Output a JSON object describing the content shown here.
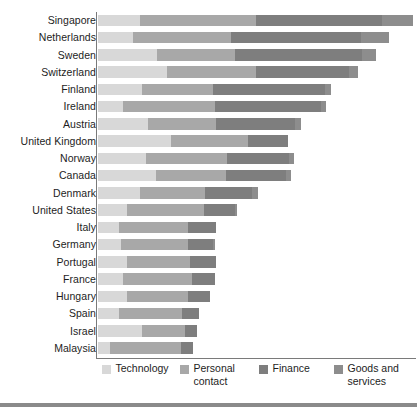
{
  "chart_data": {
    "type": "bar",
    "orientation": "horizontal",
    "stacked": true,
    "title": "",
    "subtitle": "",
    "xlabel": "",
    "ylabel": "",
    "grid": false,
    "axis_tick_labels": [],
    "legend_position": "bottom",
    "legend": [
      {
        "name": "Technology",
        "color": "#d8d8d8"
      },
      {
        "name": "Personal contact",
        "color": "#a8a8a8"
      },
      {
        "name": "Finance",
        "color": "#7e7e7e"
      },
      {
        "name": "Goods and services",
        "color": "#8d8d8d"
      }
    ],
    "series": [
      {
        "name": "Technology",
        "color": "#d8d8d8",
        "values": [
          14.0,
          11.7,
          19.4,
          22.8,
          14.7,
          8.4,
          16.6,
          24.0,
          16.0,
          19.1,
          14.0,
          9.7,
          7.1,
          7.7,
          9.7,
          8.4,
          9.7,
          6.9,
          14.4,
          4.2
        ]
      },
      {
        "name": "Personal contact",
        "color": "#a8a8a8",
        "values": [
          37.8,
          31.8,
          25.5,
          29.1,
          23.0,
          30.1,
          22.2,
          25.1,
          26.2,
          22.8,
          21.0,
          25.2,
          22.6,
          22.0,
          20.6,
          22.6,
          20.0,
          20.6,
          14.3,
          23.0
        ]
      },
      {
        "name": "Finance",
        "color": "#7e7e7e",
        "values": [
          41.2,
          42.8,
          41.6,
          30.3,
          36.8,
          34.5,
          25.7,
          13.1,
          20.6,
          19.7,
          15.6,
          10.2,
          9.2,
          8.1,
          8.3,
          7.4,
          7.2,
          5.8,
          3.9,
          4.2
        ]
      },
      {
        "name": "Goods and services",
        "color": "#8d8d8d",
        "values": [
          10.1,
          9.1,
          4.6,
          3.1,
          1.9,
          1.9,
          2.2,
          0.0,
          1.6,
          1.6,
          1.8,
          0.6,
          0.0,
          0.7,
          0.0,
          0.0,
          0.0,
          0.0,
          0.0,
          0.0
        ]
      }
    ],
    "categories": [
      "Singapore",
      "Netherlands",
      "Sweden",
      "Switzerland",
      "Finland",
      "Ireland",
      "Austria",
      "United Kingdom",
      "Norway",
      "Canada",
      "Denmark",
      "United States",
      "Italy",
      "Germany",
      "Portugal",
      "France",
      "Hungary",
      "Spain",
      "Israel",
      "Malaysia"
    ],
    "bars": [
      {
        "category": "Singapore",
        "segments": [
          14.0,
          37.8,
          41.2,
          10.1
        ],
        "total": 103.1
      },
      {
        "category": "Netherlands",
        "segments": [
          11.7,
          31.8,
          42.8,
          9.1
        ],
        "total": 95.4
      },
      {
        "category": "Sweden",
        "segments": [
          19.4,
          25.5,
          41.6,
          4.6
        ],
        "total": 91.1
      },
      {
        "category": "Switzerland",
        "segments": [
          22.8,
          29.1,
          30.3,
          3.1
        ],
        "total": 85.3
      },
      {
        "category": "Finland",
        "segments": [
          14.7,
          23.0,
          36.8,
          1.9
        ],
        "total": 76.4
      },
      {
        "category": "Ireland",
        "segments": [
          8.4,
          30.1,
          34.5,
          1.9
        ],
        "total": 74.9
      },
      {
        "category": "Austria",
        "segments": [
          16.6,
          22.2,
          25.7,
          2.2
        ],
        "total": 66.7
      },
      {
        "category": "United Kingdom",
        "segments": [
          24.0,
          25.1,
          13.1,
          0.0
        ],
        "total": 62.2
      },
      {
        "category": "Norway",
        "segments": [
          16.0,
          26.2,
          20.6,
          1.6
        ],
        "total": 64.4
      },
      {
        "category": "Canada",
        "segments": [
          19.1,
          22.8,
          19.7,
          1.6
        ],
        "total": 63.2
      },
      {
        "category": "Denmark",
        "segments": [
          14.0,
          21.0,
          15.6,
          1.8
        ],
        "total": 52.4
      },
      {
        "category": "United States",
        "segments": [
          9.7,
          25.2,
          10.2,
          0.6
        ],
        "total": 45.7
      },
      {
        "category": "Italy",
        "segments": [
          7.1,
          22.6,
          9.2,
          0.0
        ],
        "total": 38.9
      },
      {
        "category": "Germany",
        "segments": [
          7.7,
          22.0,
          8.1,
          0.7
        ],
        "total": 38.5
      },
      {
        "category": "Portugal",
        "segments": [
          9.7,
          20.6,
          8.3,
          0.0
        ],
        "total": 38.6
      },
      {
        "category": "France",
        "segments": [
          8.4,
          22.6,
          7.4,
          0.0
        ],
        "total": 38.4
      },
      {
        "category": "Hungary",
        "segments": [
          9.7,
          20.0,
          7.2,
          0.0
        ],
        "total": 36.9
      },
      {
        "category": "Spain",
        "segments": [
          6.9,
          20.6,
          5.8,
          0.0
        ],
        "total": 33.3
      },
      {
        "category": "Israel",
        "segments": [
          14.4,
          14.3,
          3.9,
          0.0
        ],
        "total": 32.6
      },
      {
        "category": "Malaysia",
        "segments": [
          4.2,
          23.0,
          4.2,
          0.0
        ],
        "total": 31.4
      }
    ],
    "xlim": [
      0,
      104
    ],
    "value_unit": "index"
  }
}
